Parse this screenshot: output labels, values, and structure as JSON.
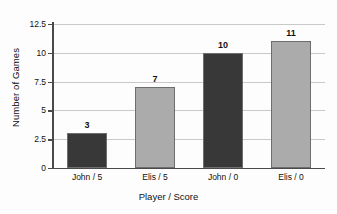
{
  "chart_data": {
    "type": "bar",
    "title": "",
    "xlabel": "Player / Score",
    "ylabel": "Number of Games",
    "categories": [
      "John / 5",
      "Elis / 5",
      "John / 0",
      "Elis / 0"
    ],
    "values": [
      3,
      7,
      10,
      11
    ],
    "value_labels": [
      "3",
      "7",
      "10",
      "11"
    ],
    "bar_colors": [
      "#383838",
      "#ababab",
      "#383838",
      "#ababab"
    ],
    "bar_border_color": "#6e6e6e",
    "ylim": [
      0,
      12.5
    ],
    "yticks": [
      0,
      2.5,
      5,
      7.5,
      10,
      12.5
    ],
    "ytick_labels": [
      "0",
      "2.5",
      "5",
      "7.5",
      "10",
      "12.5"
    ],
    "grid": true,
    "grid_color": "#c9c9c9",
    "axis_color": "#4a4a4a",
    "legend": "none",
    "background": "#fdfdfd"
  }
}
